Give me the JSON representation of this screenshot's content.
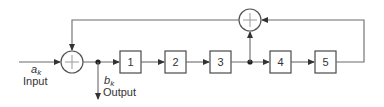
{
  "diagram": {
    "type": "block-diagram",
    "input": {
      "symbol": "a",
      "subscript": "k",
      "label": "Input"
    },
    "output": {
      "symbol": "b",
      "subscript": "k",
      "label": "Output"
    },
    "delay_stages": [
      "1",
      "2",
      "3",
      "4",
      "5"
    ],
    "adders": [
      {
        "id": "input-adder",
        "symbol": "+"
      },
      {
        "id": "feedback-adder",
        "symbol": "+"
      }
    ],
    "connections": [
      "input -> input-adder",
      "input-adder -> output tap",
      "output tap -> stage 1 -> stage 2 -> stage 3",
      "stage 3 -> tap -> feedback-adder",
      "stage 3 -> stage 4 -> stage 5",
      "stage 5 -> feedback-adder",
      "feedback-adder -> input-adder"
    ],
    "colors": {
      "line": "#6a6a6a",
      "box": "#4a4a4a",
      "text": "#333333"
    }
  }
}
